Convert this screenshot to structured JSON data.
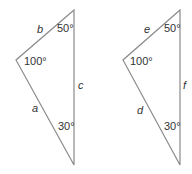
{
  "triangles": [
    {
      "angles": {
        "top": "50°",
        "left": "100°",
        "bottom": "30°"
      },
      "sides": {
        "top_left": "b",
        "bottom_left": "a",
        "right": "c"
      }
    },
    {
      "angles": {
        "top": "50°",
        "left": "100°",
        "bottom": "30°"
      },
      "sides": {
        "top_left": "e",
        "bottom_left": "d",
        "right": "f"
      }
    }
  ],
  "colors": {
    "stroke": "#8a8a8a",
    "text": "#333333"
  }
}
